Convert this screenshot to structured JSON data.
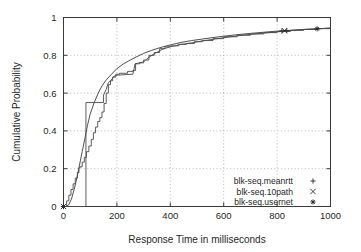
{
  "chart_data": {
    "type": "line",
    "title": "",
    "xlabel": "Response Time in milliseconds",
    "ylabel": "Cumulative Probability",
    "xlim": [
      0,
      1000
    ],
    "ylim": [
      0,
      1
    ],
    "grid": true,
    "legend_position": "bottom-right",
    "xticks": [
      "0",
      "200",
      "400",
      "600",
      "800",
      "1000"
    ],
    "xtick_values": [
      0,
      200,
      400,
      600,
      800,
      1000
    ],
    "yticks": [
      "0",
      "0.2",
      "0.4",
      "0.6",
      "0.8",
      "1"
    ],
    "ytick_values": [
      0,
      0.2,
      0.4,
      0.6,
      0.8,
      1
    ],
    "series": [
      {
        "name": "blk-seq.meanrtt",
        "marker": "+",
        "style": "smooth",
        "points": [
          [
            0,
            0.0
          ],
          [
            10,
            0.0
          ],
          [
            20,
            0.01
          ],
          [
            30,
            0.04
          ],
          [
            40,
            0.09
          ],
          [
            50,
            0.15
          ],
          [
            60,
            0.22
          ],
          [
            70,
            0.29
          ],
          [
            80,
            0.36
          ],
          [
            90,
            0.43
          ],
          [
            100,
            0.49
          ],
          [
            115,
            0.55
          ],
          [
            130,
            0.6
          ],
          [
            145,
            0.64
          ],
          [
            160,
            0.67
          ],
          [
            180,
            0.7
          ],
          [
            200,
            0.73
          ],
          [
            225,
            0.755
          ],
          [
            250,
            0.775
          ],
          [
            275,
            0.793
          ],
          [
            300,
            0.81
          ],
          [
            330,
            0.826
          ],
          [
            360,
            0.84
          ],
          [
            400,
            0.855
          ],
          [
            440,
            0.868
          ],
          [
            480,
            0.878
          ],
          [
            520,
            0.886
          ],
          [
            560,
            0.894
          ],
          [
            600,
            0.901
          ],
          [
            650,
            0.909
          ],
          [
            700,
            0.916
          ],
          [
            750,
            0.922
          ],
          [
            800,
            0.928
          ],
          [
            825,
            0.93
          ],
          [
            860,
            0.933
          ],
          [
            900,
            0.937
          ],
          [
            950,
            0.94
          ],
          [
            1000,
            0.944
          ]
        ],
        "marker_points": [
          [
            0,
            0.0
          ],
          [
            818,
            0.929
          ],
          [
            836,
            0.931
          ]
        ]
      },
      {
        "name": "blk-seq.10path",
        "marker": "×",
        "style": "staircase",
        "points": [
          [
            0,
            0.0
          ],
          [
            12,
            0.03
          ],
          [
            20,
            0.06
          ],
          [
            28,
            0.09
          ],
          [
            36,
            0.12
          ],
          [
            44,
            0.15
          ],
          [
            52,
            0.18
          ],
          [
            58,
            0.205
          ],
          [
            62,
            0.21
          ],
          [
            70,
            0.235
          ],
          [
            78,
            0.26
          ],
          [
            86,
            0.29
          ],
          [
            95,
            0.32
          ],
          [
            104,
            0.355
          ],
          [
            112,
            0.39
          ],
          [
            120,
            0.42
          ],
          [
            128,
            0.45
          ],
          [
            136,
            0.47
          ],
          [
            144,
            0.5
          ],
          [
            152,
            0.545
          ],
          [
            160,
            0.6
          ],
          [
            168,
            0.645
          ],
          [
            176,
            0.665
          ],
          [
            184,
            0.685
          ],
          [
            196,
            0.7
          ],
          [
            210,
            0.705
          ],
          [
            240,
            0.715
          ],
          [
            260,
            0.72
          ],
          [
            270,
            0.755
          ],
          [
            285,
            0.76
          ],
          [
            300,
            0.775
          ],
          [
            320,
            0.8
          ],
          [
            340,
            0.815
          ],
          [
            360,
            0.835
          ],
          [
            380,
            0.845
          ],
          [
            400,
            0.85
          ],
          [
            430,
            0.858
          ],
          [
            460,
            0.862
          ],
          [
            490,
            0.872
          ],
          [
            520,
            0.878
          ],
          [
            560,
            0.888
          ],
          [
            600,
            0.898
          ],
          [
            650,
            0.906
          ],
          [
            700,
            0.913
          ],
          [
            750,
            0.92
          ],
          [
            800,
            0.926
          ],
          [
            850,
            0.932
          ],
          [
            900,
            0.937
          ],
          [
            950,
            0.941
          ],
          [
            1000,
            0.945
          ]
        ],
        "marker_points": [
          [
            0,
            0.0
          ],
          [
            828,
            0.93
          ]
        ]
      },
      {
        "name": "blk-seq.usernet",
        "marker": "✳",
        "style": "step-sharp",
        "points": [
          [
            0,
            0.0
          ],
          [
            84,
            0.0
          ],
          [
            84,
            0.55
          ],
          [
            150,
            0.55
          ],
          [
            150,
            0.59
          ],
          [
            160,
            0.62
          ],
          [
            168,
            0.655
          ],
          [
            176,
            0.665
          ],
          [
            190,
            0.69
          ],
          [
            200,
            0.695
          ],
          [
            260,
            0.7
          ],
          [
            268,
            0.755
          ],
          [
            300,
            0.765
          ],
          [
            320,
            0.79
          ],
          [
            345,
            0.812
          ],
          [
            370,
            0.832
          ],
          [
            400,
            0.845
          ],
          [
            440,
            0.857
          ],
          [
            480,
            0.866
          ],
          [
            520,
            0.876
          ],
          [
            570,
            0.887
          ],
          [
            620,
            0.897
          ],
          [
            680,
            0.908
          ],
          [
            740,
            0.916
          ],
          [
            800,
            0.924
          ],
          [
            860,
            0.932
          ],
          [
            920,
            0.938
          ],
          [
            1000,
            0.944
          ]
        ],
        "marker_points": [
          [
            0,
            0.0
          ],
          [
            950,
            0.94
          ]
        ]
      }
    ]
  },
  "legend": {
    "entries": [
      {
        "label": "blk-seq.meanrtt",
        "marker": "plus"
      },
      {
        "label": "blk-seq.10path",
        "marker": "cross"
      },
      {
        "label": "blk-seq.usernet",
        "marker": "star"
      }
    ]
  },
  "colors": {
    "axis": "#3a3a3a",
    "grid": "#a8a8a8",
    "series": "#3c3c3c",
    "background": "#ffffff"
  }
}
